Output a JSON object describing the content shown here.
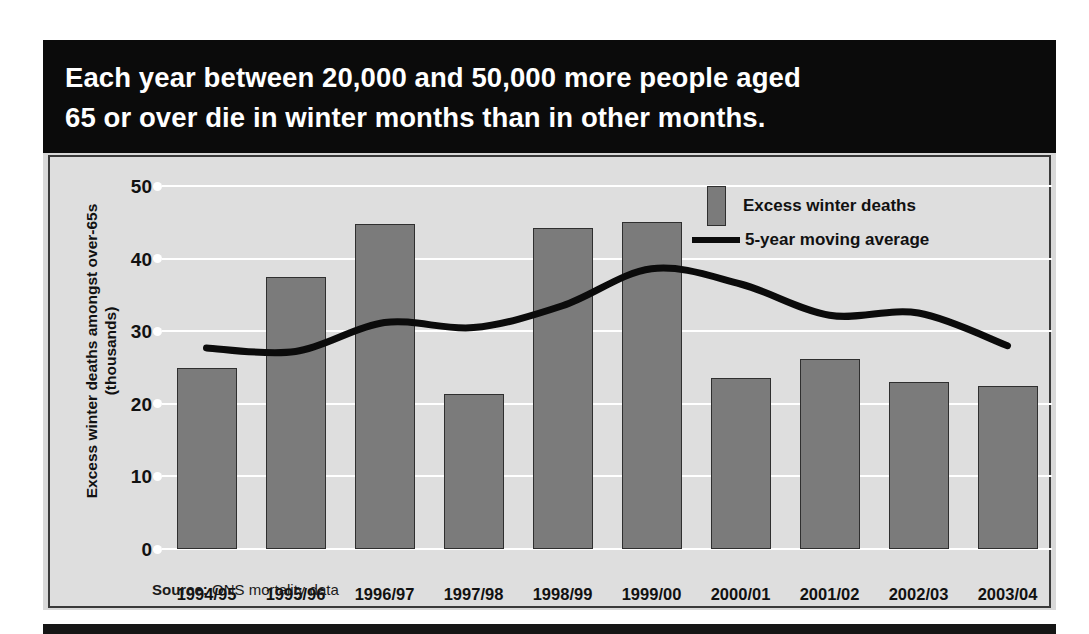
{
  "headline": {
    "line1": "Each year between 20,000 and 50,000 more people aged",
    "line2": "65 or over die in winter months than in other months."
  },
  "legend": {
    "bars_label": "Excess winter deaths",
    "line_label": "5-year moving average"
  },
  "source": {
    "prefix": "Source:",
    "text": " ONS mortality data"
  },
  "axis": {
    "y_title_line1": "Excess winter deaths amongst over-65s",
    "y_title_line2": "(thousands)",
    "y_ticks": [
      "50",
      "40",
      "30",
      "20",
      "10",
      "0"
    ]
  },
  "colors": {
    "bar_fill": "#7b7b7b",
    "bar_border": "#2f2f2f",
    "line": "#0b0b0b",
    "panel_bg": "#dedede",
    "banner_bg": "#0b0b0b",
    "gridline": "#ffffff"
  },
  "chart_data": {
    "type": "bar",
    "title": "Each year between 20,000 and 50,000 more people aged 65 or over die in winter months than in other months.",
    "xlabel": "",
    "ylabel": "Excess winter deaths amongst over-65s (thousands)",
    "ylim": [
      0,
      50
    ],
    "yticks": [
      0,
      10,
      20,
      30,
      40,
      50
    ],
    "grid": true,
    "legend_position": "top-right",
    "source": "Source: ONS mortality data",
    "categories": [
      "1994/95",
      "1995/96",
      "1996/97",
      "1997/98",
      "1998/99",
      "1999/00",
      "2000/01",
      "2001/02",
      "2002/03",
      "2003/04"
    ],
    "series": [
      {
        "name": "Excess winter deaths",
        "type": "bar",
        "values": [
          25.0,
          37.4,
          44.8,
          21.4,
          44.2,
          45.1,
          23.5,
          26.2,
          23.0,
          22.4
        ]
      },
      {
        "name": "5-year moving average",
        "type": "line",
        "values": [
          27.7,
          27.2,
          31.2,
          30.5,
          33.5,
          38.6,
          36.5,
          32.2,
          32.5,
          28.0
        ]
      }
    ]
  }
}
